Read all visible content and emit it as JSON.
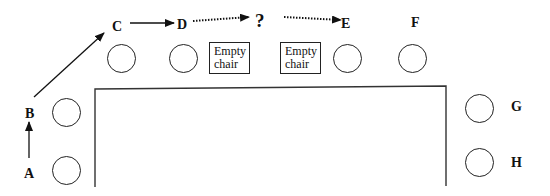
{
  "labels": {
    "A": "A",
    "B": "B",
    "C": "C",
    "D": "D",
    "E": "E",
    "F": "F",
    "G": "G",
    "H": "H",
    "question": "?"
  },
  "empty_chairs": [
    {
      "line1": "Empty",
      "line2": "chair"
    },
    {
      "line1": "Empty",
      "line2": "chair"
    }
  ],
  "colors": {
    "line": "#222222",
    "text": "#111111",
    "background": "#ffffff"
  }
}
